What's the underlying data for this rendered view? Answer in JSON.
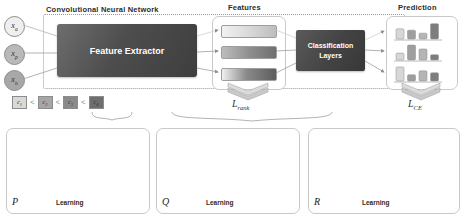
{
  "diagram": {
    "top_section": {
      "cnn_label": "Convolutional Neural Network",
      "features_label": "Features",
      "prediction_label": "Prediction",
      "feature_extractor_label": "Feature Extractor",
      "classification_layers_label": "Classification\nLayers",
      "classification_layers_line1": "Classification",
      "classification_layers_line2": "Layers",
      "inputs": [
        {
          "name": "anchor",
          "label": "x",
          "sub": "a",
          "shade": "light"
        },
        {
          "name": "positive",
          "label": "x",
          "sub": "p",
          "shade": "mid"
        },
        {
          "name": "negative",
          "label": "x",
          "sub": "n",
          "shade": "dark"
        }
      ],
      "feature_bars": [
        {
          "name": "feature-vector-anchor",
          "style": "light"
        },
        {
          "name": "feature-vector-positive",
          "style": "mid"
        },
        {
          "name": "feature-vector-negative",
          "style": "dark"
        }
      ],
      "predictions": [
        {
          "name": "prediction-histogram-anchor",
          "bars": [
            0.55,
            0.45,
            0.22,
            0.95
          ]
        },
        {
          "name": "prediction-histogram-positive",
          "bars": [
            0.3,
            0.92,
            0.62,
            0.18
          ]
        },
        {
          "name": "prediction-histogram-negative",
          "bars": [
            0.85,
            0.25,
            0.55,
            0.4
          ]
        }
      ],
      "losses": {
        "rank": {
          "symbol": "L",
          "sub": "rank"
        },
        "ce": {
          "symbol": "L",
          "sub": "CE"
        }
      }
    },
    "legend": {
      "items": [
        {
          "label": "c",
          "sub": "1",
          "color": "#d9d9d9"
        },
        {
          "label": "c",
          "sub": "2",
          "color": "#a6a6a6"
        },
        {
          "label": "c",
          "sub": "3",
          "color": "#8a8a8a"
        },
        {
          "label": "c",
          "sub": "4",
          "color": "#6e6e6e"
        }
      ],
      "separator": "<"
    },
    "bottom_panels": [
      {
        "name": "panel-p",
        "symbol": "P",
        "learning_label": "Learning",
        "quadrant_labels": [
          {
            "label": "c",
            "sub": "1",
            "pos": "top-left"
          },
          {
            "label": "c",
            "sub": "2",
            "pos": "top-right"
          },
          {
            "label": "c",
            "sub": "4",
            "pos": "bottom-left"
          },
          {
            "label": "c",
            "sub": "3",
            "pos": "bottom-right"
          }
        ],
        "before": {
          "anchor": [
            0.46,
            0.5
          ],
          "points": [
            [
              0.3,
              0.2
            ],
            [
              0.66,
              0.36
            ]
          ]
        },
        "after": {
          "anchor": [
            0.46,
            0.5
          ],
          "points": [
            [
              0.26,
              0.2
            ],
            [
              0.84,
              0.22
            ]
          ]
        }
      },
      {
        "name": "panel-q",
        "symbol": "Q",
        "learning_label": "Learning",
        "quadrant_labels": [
          {
            "label": "c",
            "sub": "1",
            "pos": "top-left"
          },
          {
            "label": "c",
            "sub": "2",
            "pos": "top-right"
          },
          {
            "label": "c",
            "sub": "4",
            "pos": "bottom-left"
          },
          {
            "label": "c",
            "sub": "3",
            "pos": "bottom-right"
          }
        ],
        "before": {
          "anchor": [
            0.78,
            0.46
          ],
          "points": [
            [
              0.14,
              0.22
            ],
            [
              0.4,
              0.7
            ]
          ]
        },
        "after": {
          "anchor": [
            0.8,
            0.44
          ],
          "points": [
            [
              0.42,
              0.2
            ],
            [
              0.32,
              0.82
            ]
          ]
        }
      },
      {
        "name": "panel-r",
        "symbol": "R",
        "learning_label": "Learning",
        "quadrant_labels": [
          {
            "label": "c",
            "sub": "1",
            "pos": "top-left"
          },
          {
            "label": "c",
            "sub": "2",
            "pos": "top-right"
          },
          {
            "label": "c",
            "sub": "4",
            "pos": "bottom-left"
          },
          {
            "label": "c",
            "sub": "3",
            "pos": "bottom-right"
          }
        ],
        "before": {
          "anchor": [
            0.62,
            0.78
          ],
          "points": [
            [
              0.52,
              0.4
            ],
            [
              0.12,
              0.7
            ]
          ]
        },
        "after": {
          "anchor": [
            0.74,
            0.8
          ],
          "points": [
            [
              0.66,
              0.18
            ],
            [
              0.3,
              0.6
            ]
          ]
        }
      }
    ]
  }
}
